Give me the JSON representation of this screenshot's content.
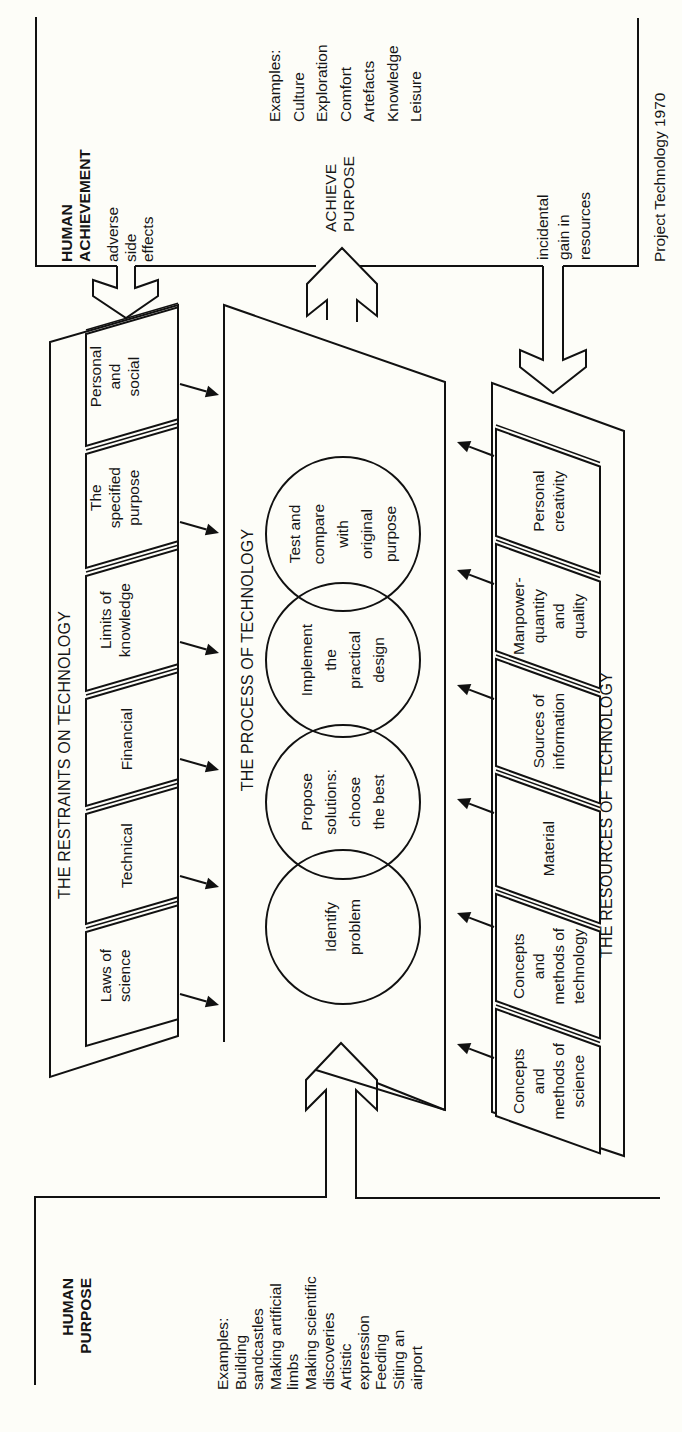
{
  "human_purpose": {
    "title": [
      "HUMAN",
      "PURPOSE"
    ],
    "examples": [
      "Examples:",
      "Building",
      "sandcastles",
      "Making artificial",
      "limbs",
      "Making scientific",
      "discoveries",
      "Artistic",
      "expression",
      "Feeding",
      "Siting an",
      "airport"
    ]
  },
  "human_achievement": {
    "title": [
      "HUMAN",
      "ACHIEVEMENT"
    ],
    "side_effects": [
      "adverse",
      "side",
      "effects"
    ],
    "achieve_label": [
      "ACHIEVE",
      "PURPOSE"
    ],
    "examples": [
      "Examples:",
      "Culture",
      "Exploration",
      "Comfort",
      "Artefacts",
      "Knowledge",
      "Leisure"
    ],
    "incidental": [
      "incidental",
      "gain in",
      "resources"
    ],
    "credit": "Project Technology 1970"
  },
  "restraints": {
    "heading": "THE RESTRAINTS ON TECHNOLOGY",
    "items": [
      {
        "lines": [
          "Laws of",
          "science"
        ]
      },
      {
        "lines": [
          "Technical"
        ]
      },
      {
        "lines": [
          "Financial"
        ]
      },
      {
        "lines": [
          "Limits of",
          "knowledge"
        ]
      },
      {
        "lines": [
          "The",
          "specified",
          "purpose"
        ]
      },
      {
        "lines": [
          "Personal",
          "and",
          "social"
        ]
      }
    ]
  },
  "process": {
    "heading": "THE PROCESS OF TECHNOLOGY",
    "stages": [
      {
        "lines": [
          "Identify",
          "problem"
        ]
      },
      {
        "lines": [
          "Propose",
          "solutions:",
          "choose",
          "the best"
        ]
      },
      {
        "lines": [
          "Implement",
          "the",
          "practical",
          "design"
        ]
      },
      {
        "lines": [
          "Test and",
          "compare",
          "with",
          "original",
          "purpose"
        ]
      }
    ]
  },
  "resources": {
    "heading": "THE RESOURCES OF TECHNOLOGY",
    "items": [
      {
        "lines": [
          "Concepts",
          "and",
          "methods of",
          "science"
        ]
      },
      {
        "lines": [
          "Concepts",
          "and",
          "methods of",
          "technology"
        ]
      },
      {
        "lines": [
          "Material"
        ]
      },
      {
        "lines": [
          "Sources of",
          "information"
        ]
      },
      {
        "lines": [
          "Manpower-",
          "quantity",
          "and",
          "quality"
        ]
      },
      {
        "lines": [
          "Personal",
          "creativity"
        ]
      }
    ]
  }
}
